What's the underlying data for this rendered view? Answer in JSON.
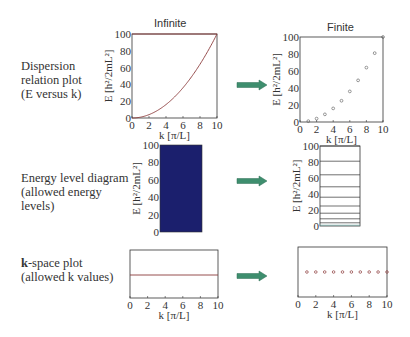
{
  "titles": {
    "infinite": "Infinite",
    "finite": "Finite"
  },
  "rows": [
    {
      "label_lines": [
        "Dispersion",
        "relation plot",
        "(E versus k)"
      ]
    },
    {
      "label_lines": [
        "Energy level diagram",
        "(allowed energy",
        "levels)"
      ]
    },
    {
      "label_bold": "k",
      "label_rest": "-space plot",
      "label_line2": "(allowed k values)"
    }
  ],
  "axes": {
    "x_label": "k [π/L]",
    "y_label": "E [h²/2mL²]",
    "x_ticks": [
      "0",
      "2",
      "4",
      "6",
      "8",
      "10"
    ],
    "y_ticks": [
      "0",
      "20",
      "40",
      "60",
      "80",
      "100"
    ]
  },
  "colors": {
    "curve": "#8b3a3a",
    "energy_fill": "#1b1f6d",
    "arrow": "#3e8e6e",
    "frame": "#333333"
  },
  "chart_data": [
    {
      "type": "line",
      "title": "Infinite — Dispersion relation (E versus k)",
      "xlabel": "k [π/L]",
      "ylabel": "E [h²/2mL²]",
      "xlim": [
        0,
        10
      ],
      "ylim": [
        0,
        100
      ],
      "function": "E = k^2",
      "x": [
        0,
        1,
        2,
        3,
        4,
        5,
        6,
        7,
        8,
        9,
        10
      ],
      "y": [
        0,
        1,
        4,
        9,
        16,
        25,
        36,
        49,
        64,
        81,
        100
      ]
    },
    {
      "type": "scatter",
      "title": "Finite — Dispersion relation (E versus k)",
      "xlabel": "k [π/L]",
      "ylabel": "E [h²/2mL²]",
      "xlim": [
        0,
        10
      ],
      "ylim": [
        0,
        100
      ],
      "x": [
        1,
        2,
        3,
        4,
        5,
        6,
        7,
        8,
        9,
        10
      ],
      "y": [
        1,
        4,
        9,
        16,
        25,
        36,
        49,
        64,
        81,
        100
      ]
    },
    {
      "type": "area",
      "title": "Infinite — Energy level diagram (continuous)",
      "ylabel": "E [h²/2mL²]",
      "ylim": [
        0,
        100
      ],
      "filled_range": [
        0,
        100
      ]
    },
    {
      "type": "line",
      "title": "Finite — Energy level diagram (allowed levels)",
      "ylabel": "E [h²/2mL²]",
      "ylim": [
        0,
        100
      ],
      "levels": [
        1,
        4,
        9,
        16,
        25,
        36,
        49,
        64,
        81,
        100
      ]
    },
    {
      "type": "line",
      "title": "Infinite — k-space plot (continuous)",
      "xlabel": "k [π/L]",
      "xlim": [
        0,
        10
      ],
      "continuous_range": [
        0,
        10
      ]
    },
    {
      "type": "scatter",
      "title": "Finite — k-space plot (allowed k values)",
      "xlabel": "k [π/L]",
      "xlim": [
        0,
        10
      ],
      "x": [
        1,
        2,
        3,
        4,
        5,
        6,
        7,
        8,
        9,
        10
      ]
    }
  ]
}
